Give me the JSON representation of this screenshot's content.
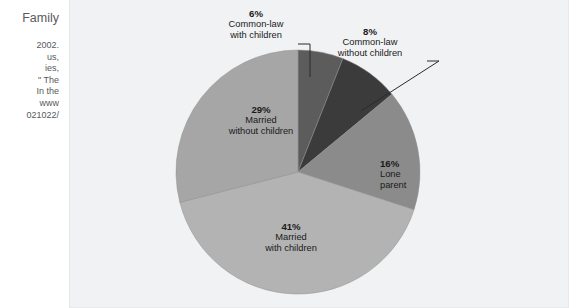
{
  "caption": {
    "heading": "Family",
    "lines": [
      "2002.",
      "us,",
      "ies,",
      "\" The",
      "In the",
      "www",
      "021022/"
    ]
  },
  "chart_data": {
    "type": "pie",
    "title": "",
    "legend_position": "callout-labels",
    "unit": "%",
    "start_angle_deg": 0,
    "direction": "clockwise",
    "categories": [
      "Common-law with children",
      "Common-law without children",
      "Lone parent",
      "Married with children",
      "Married without children"
    ],
    "values": [
      6,
      8,
      16,
      41,
      29
    ],
    "slices": [
      {
        "id": "common-law-with-children",
        "percent_label": "6%",
        "value": 6,
        "name_line1": "Common-law",
        "name_line2": "with children",
        "color": "#5c5c5c",
        "label_placement": "outside-top-left",
        "has_leader_line": true
      },
      {
        "id": "common-law-without-children",
        "percent_label": "8%",
        "value": 8,
        "name_line1": "Common-law",
        "name_line2": "without children",
        "color": "#3b3b3b",
        "label_placement": "outside-top-right",
        "has_leader_line": true
      },
      {
        "id": "lone-parent",
        "percent_label": "16%",
        "value": 16,
        "name_line1": "Lone",
        "name_line2": "parent",
        "color": "#8b8b8b",
        "label_placement": "inside",
        "has_leader_line": false
      },
      {
        "id": "married-with-children",
        "percent_label": "41%",
        "value": 41,
        "name_line1": "Married",
        "name_line2": "with children",
        "color": "#b3b3b3",
        "label_placement": "inside",
        "has_leader_line": false
      },
      {
        "id": "married-without-children",
        "percent_label": "29%",
        "value": 29,
        "name_line1": "Married",
        "name_line2": "without children",
        "color": "#a6a6a6",
        "label_placement": "inside",
        "has_leader_line": false
      }
    ]
  },
  "colors": {
    "panel_background": "#f1f2f3",
    "page_background": "#ffffff",
    "caption_text": "#58595b",
    "label_text": "#1a1a1a",
    "leader_line": "#2b2b2b"
  }
}
